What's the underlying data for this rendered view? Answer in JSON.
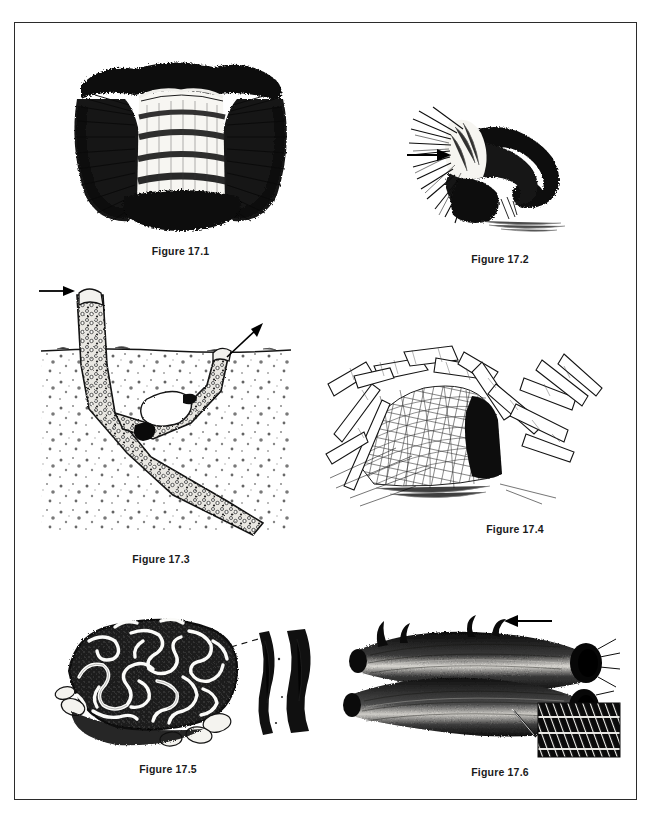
{
  "page": {
    "plate_title": "",
    "background_color": "#ffffff",
    "frame_color": "#2b2b2b",
    "ink_color": "#111111"
  },
  "figures": [
    {
      "id": "fig-17-1",
      "caption": "Figure 17.1",
      "subject": "tubular silk retreat with flared hairy rim, cut-away view",
      "has_arrow": false,
      "arrow_direction": "",
      "has_inset": false
    },
    {
      "id": "fig-17-2",
      "caption": "Figure 17.2",
      "subject": "curved silk tube retreat with frayed flared entrance",
      "has_arrow": true,
      "arrow_direction": "right",
      "has_inset": false
    },
    {
      "id": "fig-17-3",
      "caption": "Figure 17.3",
      "subject": "branched subterranean burrow with soil cross-section and two turret openings",
      "has_arrow": true,
      "arrow_direction": "right-and-up-right",
      "has_inset": false
    },
    {
      "id": "fig-17-4",
      "caption": "Figure 17.4",
      "subject": "sheet web funnel retreat among grass stems with dark entrance",
      "has_arrow": false,
      "arrow_direction": "",
      "has_inset": false
    },
    {
      "id": "fig-17-5",
      "caption": "Figure 17.5",
      "subject": "rock covered in meandering maze-like silk lines, with magnified strand detail",
      "has_arrow": false,
      "arrow_direction": "",
      "has_inset": true,
      "inset_subject": "magnified pair of silk bands separated by a pale gap"
    },
    {
      "id": "fig-17-6",
      "caption": "Figure 17.6",
      "subject": "bundled tubular silk retreats seen end-on, with magnified weave detail",
      "has_arrow": true,
      "arrow_direction": "left",
      "has_inset": true,
      "inset_subject": "magnified diagonally hatched silk weave swatch"
    }
  ]
}
